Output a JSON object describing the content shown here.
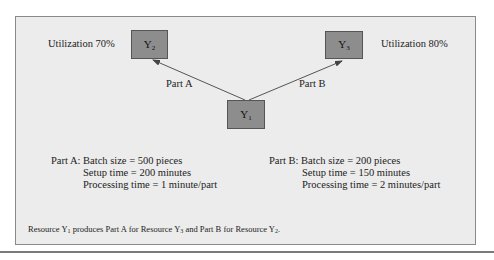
{
  "diagram": {
    "colors": {
      "frame_fill": "#ececec",
      "frame_border": "#8a8a8a",
      "node_fill": "#8d8d8d",
      "node_border": "#555555",
      "arrow": "#444444"
    },
    "nodes": {
      "y1": {
        "base": "Y",
        "sub": "1"
      },
      "y2": {
        "base": "Y",
        "sub": "2",
        "utilization": "Utilization 70%"
      },
      "y3": {
        "base": "Y",
        "sub": "3",
        "utilization": "Utilization 80%"
      }
    },
    "edges": [
      {
        "from": "Y1",
        "to": "Y2",
        "label": "Part B"
      },
      {
        "from": "Y1",
        "to": "Y3",
        "label": "Part A"
      }
    ],
    "part_a": {
      "prefix": "Part A:",
      "batch": "Batch size = 500 pieces",
      "setup": "Setup time = 200 minutes",
      "processing": "Processing time = 1 minute/part"
    },
    "part_b": {
      "prefix": "Part B:",
      "batch": "Batch size = 200 pieces",
      "setup": "Setup time = 150 minutes",
      "processing": "Processing time = 2 minutes/part"
    },
    "note": {
      "t1": "Resource Y",
      "s1": "1",
      "t2": " produces Part A for Resource Y",
      "s2": "3",
      "t3": " and Part B for Resource Y",
      "s3": "2",
      "t4": "."
    }
  }
}
